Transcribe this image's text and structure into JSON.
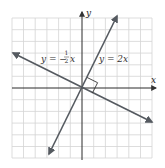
{
  "diagram": {
    "type": "coordinate-plane",
    "axes": {
      "x_label": "x",
      "y_label": "y"
    },
    "grid": {
      "visible": true,
      "range": [
        -6,
        6
      ],
      "color": "#d4d4d4"
    },
    "lines": [
      {
        "name": "line-y-2x",
        "equation": "y = 2x",
        "label_prefix": "y = 2x",
        "slope": 2,
        "color": "#555a60"
      },
      {
        "name": "line-y-neg-half-x",
        "equation": "y = -1/2 x",
        "label_prefix": "y = −",
        "label_num": "1",
        "label_den": "2",
        "label_suffix": "x",
        "slope": -0.5,
        "color": "#555a60"
      }
    ],
    "annotation": {
      "right_angle_marker": true,
      "meaning": "perpendicular"
    }
  }
}
